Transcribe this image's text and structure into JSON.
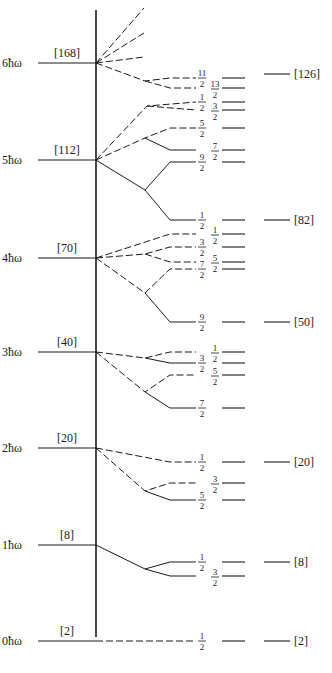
{
  "diagram": {
    "axis_x": 96,
    "axis_top": 10,
    "axis_bottom": 637,
    "oscillator_levels": [
      {
        "label": "6ħω",
        "magic": "[168]",
        "y": 63
      },
      {
        "label": "5ħω",
        "magic": "[112]",
        "y": 160
      },
      {
        "label": "4ħω",
        "magic": "[70]",
        "y": 258
      },
      {
        "label": "3ħω",
        "magic": "[40]",
        "y": 352
      },
      {
        "label": "2ħω",
        "magic": "[20]",
        "y": 448
      },
      {
        "label": "1ħω",
        "magic": "[8]",
        "y": 545
      },
      {
        "label": "0ħω",
        "magic": "[2]",
        "y": 641
      }
    ],
    "split_levels": [
      {
        "j": "11/2",
        "y": 78,
        "col": 1
      },
      {
        "j": "13/2",
        "y": 88,
        "col": 2
      },
      {
        "j": "1/2",
        "y": 102,
        "col": 1
      },
      {
        "j": "3/2",
        "y": 110,
        "col": 2
      },
      {
        "j": "5/2",
        "y": 128,
        "col": 1
      },
      {
        "j": "7/2",
        "y": 150,
        "col": 2
      },
      {
        "j": "9/2",
        "y": 162,
        "col": 1
      },
      {
        "j": "1/2",
        "y": 220,
        "col": 1
      },
      {
        "j": "1/2",
        "y": 234,
        "col": 2
      },
      {
        "j": "3/2",
        "y": 247,
        "col": 1
      },
      {
        "j": "5/2",
        "y": 262,
        "col": 2
      },
      {
        "j": "7/2",
        "y": 269,
        "col": 1
      },
      {
        "j": "9/2",
        "y": 322,
        "col": 1
      },
      {
        "j": "1/2",
        "y": 352,
        "col": 2
      },
      {
        "j": "3/2",
        "y": 363,
        "col": 1
      },
      {
        "j": "5/2",
        "y": 375,
        "col": 2
      },
      {
        "j": "7/2",
        "y": 408,
        "col": 1
      },
      {
        "j": "1/2",
        "y": 462,
        "col": 1
      },
      {
        "j": "3/2",
        "y": 483,
        "col": 2
      },
      {
        "j": "5/2",
        "y": 500,
        "col": 1
      },
      {
        "j": "1/2",
        "y": 562,
        "col": 1
      },
      {
        "j": "3/2",
        "y": 576,
        "col": 2
      },
      {
        "j": "1/2",
        "y": 641,
        "col": 1
      }
    ],
    "magic_numbers_right": [
      {
        "label": "[126]",
        "y": 74
      },
      {
        "label": "[82]",
        "y": 220
      },
      {
        "label": "[50]",
        "y": 322
      },
      {
        "label": "[20]",
        "y": 462
      },
      {
        "label": "[8]",
        "y": 562
      },
      {
        "label": "[2]",
        "y": 641
      }
    ]
  }
}
